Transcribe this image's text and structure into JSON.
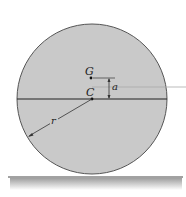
{
  "diagram": {
    "labels": {
      "G": "G",
      "C": "C",
      "a": "a",
      "r": "r"
    },
    "colors": {
      "disk_fill": "#c8c8c8",
      "stroke": "#333333",
      "ground_shadow": "#bdbdbd",
      "leader": "#b0b0b0"
    }
  }
}
